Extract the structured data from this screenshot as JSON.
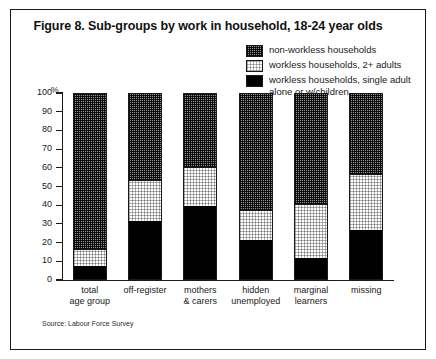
{
  "figure": {
    "title": "Figure 8. Sub-groups by work in household, 18-24 year olds",
    "source": "Source: Labour Force Survey",
    "y_unit": "%"
  },
  "legend": {
    "items": [
      {
        "label": "non-workless households",
        "swatch": "dark-checker-swatch",
        "color": "#8e8e8e"
      },
      {
        "label": "workless households, 2+ adults",
        "swatch": "light-stipple-swatch",
        "color": "#fdfdfd"
      },
      {
        "label": "workless households, single adult alone or w/children",
        "swatch": "solid-black-swatch",
        "color": "#000000"
      }
    ]
  },
  "chart_data": {
    "type": "bar",
    "stacked": true,
    "title": "Figure 8. Sub-groups by work in household, 18-24 year olds",
    "xlabel": "",
    "ylabel": "%",
    "ylim": [
      0,
      100
    ],
    "yticks": [
      0,
      10,
      20,
      30,
      40,
      50,
      60,
      70,
      80,
      90,
      100
    ],
    "ytick_labels": [
      "0",
      "10",
      "20",
      "30",
      "40",
      "50",
      "60",
      "70",
      "80",
      "90",
      "100"
    ],
    "grid": false,
    "legend_position": "top-right",
    "categories": [
      "total age group",
      "off-register",
      "mothers & carers",
      "hidden unemployed",
      "marginal learners",
      "missing"
    ],
    "category_lines": [
      [
        "total",
        "age group"
      ],
      [
        "off-register"
      ],
      [
        "mothers",
        "& carers"
      ],
      [
        "hidden",
        "unemployed"
      ],
      [
        "marginal",
        "learners"
      ],
      [
        "missing"
      ]
    ],
    "series": [
      {
        "name": "workless households, single adult alone or w/children",
        "values": [
          7,
          31,
          39,
          21,
          11,
          26
        ]
      },
      {
        "name": "workless households, 2+ adults",
        "values": [
          10,
          23,
          22,
          17,
          30,
          31
        ]
      },
      {
        "name": "non-workless households",
        "values": [
          83,
          46,
          39,
          62,
          59,
          43
        ]
      }
    ],
    "cumulative_tops": {
      "single_adult": [
        7,
        31,
        39,
        21,
        11,
        26
      ],
      "plus_two_adults": [
        17,
        54,
        61,
        38,
        41,
        57
      ],
      "total": [
        100,
        100,
        100,
        100,
        100,
        100
      ]
    }
  }
}
